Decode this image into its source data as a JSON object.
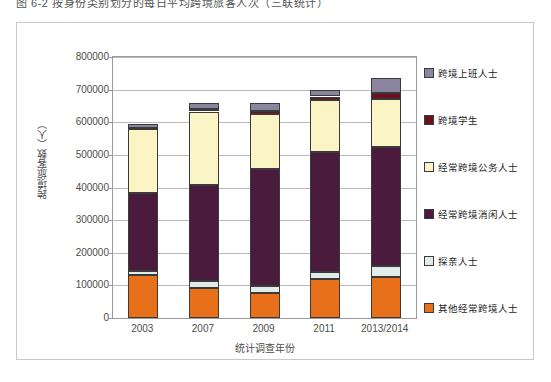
{
  "caption": "图 6-2  按身份类别划分的每日平均跨境旅客人次（三联统计）",
  "chart_data": {
    "type": "bar",
    "stacked": true,
    "title": "",
    "xlabel": "统计调查年份",
    "ylabel": "跨境旅客数（人）",
    "categories": [
      "2003",
      "2007",
      "2009",
      "2011",
      "2013/2014"
    ],
    "ylim": [
      0,
      800000
    ],
    "ytick_labels": [
      "0",
      "100000",
      "200000",
      "300000",
      "400000",
      "500000",
      "600000",
      "700000",
      "800000"
    ],
    "ytick_values": [
      0,
      100000,
      200000,
      300000,
      400000,
      500000,
      600000,
      700000,
      800000
    ],
    "grid": true,
    "legend_position": "right",
    "series": [
      {
        "name": "其他经常跨境人士",
        "color": "#E8701A",
        "values": [
          133000,
          93000,
          78000,
          119000,
          126000
        ]
      },
      {
        "name": "探亲人士",
        "color": "#E2EDE9",
        "values": [
          12000,
          19000,
          20000,
          23000,
          33000
        ]
      },
      {
        "name": "经常跨境消闲人士",
        "color": "#4A1B3D",
        "values": [
          238000,
          297000,
          360000,
          366000,
          365000
        ]
      },
      {
        "name": "经常跨境公务人士",
        "color": "#FBF4C4",
        "values": [
          196000,
          224000,
          168000,
          161000,
          146000
        ]
      },
      {
        "name": "跨境学生",
        "color": "#6B1220",
        "values": [
          4000,
          7000,
          8000,
          10000,
          20000
        ]
      },
      {
        "name": "跨境上班人士",
        "color": "#8A849E",
        "values": [
          11000,
          19000,
          24000,
          21000,
          45000
        ]
      }
    ],
    "totals": [
      594000,
      659000,
      658000,
      700000,
      735000
    ]
  }
}
